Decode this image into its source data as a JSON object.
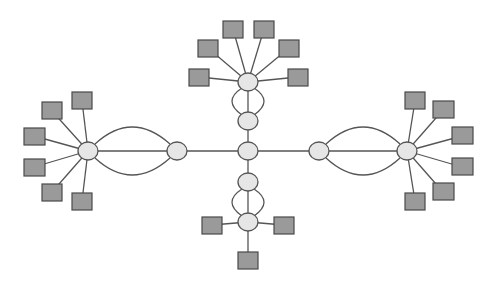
{
  "diagram": {
    "type": "network-graph",
    "colors": {
      "background": "#ffffff",
      "edge": "#555555",
      "circle_fill": "#e6e6e6",
      "square_fill": "#9a9a9a",
      "outline": "#4a4a4a"
    },
    "circle_nodes": [
      {
        "id": "center",
        "cx": 248,
        "cy": 151
      },
      {
        "id": "up-1",
        "cx": 248,
        "cy": 121
      },
      {
        "id": "up-hub",
        "cx": 248,
        "cy": 82
      },
      {
        "id": "down-1",
        "cx": 248,
        "cy": 182
      },
      {
        "id": "down-hub",
        "cx": 248,
        "cy": 222
      },
      {
        "id": "left-1",
        "cx": 177,
        "cy": 151
      },
      {
        "id": "left-hub",
        "cx": 88,
        "cy": 151
      },
      {
        "id": "right-1",
        "cx": 319,
        "cy": 151
      },
      {
        "id": "right-hub",
        "cx": 407,
        "cy": 151
      }
    ],
    "square_nodes": [
      {
        "hub": "up-hub",
        "x": 189,
        "y": 69
      },
      {
        "hub": "up-hub",
        "x": 198,
        "y": 40
      },
      {
        "hub": "up-hub",
        "x": 223,
        "y": 21
      },
      {
        "hub": "up-hub",
        "x": 254,
        "y": 21
      },
      {
        "hub": "up-hub",
        "x": 279,
        "y": 40
      },
      {
        "hub": "up-hub",
        "x": 288,
        "y": 69
      },
      {
        "hub": "down-hub",
        "x": 202,
        "y": 217
      },
      {
        "hub": "down-hub",
        "x": 274,
        "y": 217
      },
      {
        "hub": "down-hub",
        "x": 238,
        "y": 252
      },
      {
        "hub": "left-hub",
        "x": 72,
        "y": 92
      },
      {
        "hub": "left-hub",
        "x": 42,
        "y": 102
      },
      {
        "hub": "left-hub",
        "x": 24,
        "y": 128
      },
      {
        "hub": "left-hub",
        "x": 24,
        "y": 159
      },
      {
        "hub": "left-hub",
        "x": 42,
        "y": 184
      },
      {
        "hub": "left-hub",
        "x": 72,
        "y": 193
      },
      {
        "hub": "right-hub",
        "x": 405,
        "y": 92
      },
      {
        "hub": "right-hub",
        "x": 433,
        "y": 101
      },
      {
        "hub": "right-hub",
        "x": 452,
        "y": 127
      },
      {
        "hub": "right-hub",
        "x": 452,
        "y": 158
      },
      {
        "hub": "right-hub",
        "x": 433,
        "y": 183
      },
      {
        "hub": "right-hub",
        "x": 405,
        "y": 193
      }
    ]
  }
}
